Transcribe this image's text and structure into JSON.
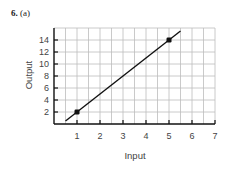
{
  "problem": {
    "number": "6.",
    "part": "(a)"
  },
  "colors": {
    "grid": "#bdbdbd",
    "axis": "#111111",
    "line": "#111111",
    "point": "#111111",
    "text": "#444444"
  },
  "chart_data": {
    "type": "line",
    "title": "",
    "xlabel": "Input",
    "ylabel": "Output",
    "xlim": [
      0,
      7
    ],
    "ylim": [
      0,
      16
    ],
    "x_ticks": [
      1,
      2,
      3,
      4,
      5,
      6,
      7
    ],
    "y_ticks": [
      2,
      4,
      6,
      8,
      10,
      12,
      14
    ],
    "grid": true,
    "grid_x_step": 0.5,
    "grid_y_step": 2,
    "legend": null,
    "series": [
      {
        "name": "line",
        "equation": "y = 3x - 1",
        "x": [
          0.5,
          5.5
        ],
        "y": [
          0.5,
          15.5
        ]
      }
    ],
    "points": [
      {
        "x": 1,
        "y": 2
      },
      {
        "x": 5,
        "y": 14
      }
    ]
  }
}
